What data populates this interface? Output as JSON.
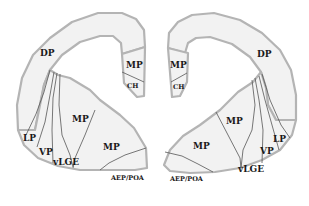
{
  "diagram": {
    "colors": {
      "tissue_fill": "#f2f2f2",
      "outline": "#b4b4b4",
      "boundary_lines": "#555555",
      "label_text": "#1a1a1a",
      "background": "#ffffff"
    },
    "left_hemisphere": {
      "labels": {
        "dp": "DP",
        "mp_top": "MP",
        "ch": "CH",
        "lp": "LP",
        "vp": "VP",
        "vlge": "vLGE",
        "mp_mid": "MP",
        "mp_lower": "MP",
        "aep_poa": "AEP/POA"
      }
    },
    "right_hemisphere": {
      "labels": {
        "dp": "DP",
        "mp_top": "MP",
        "ch": "CH",
        "lp": "LP",
        "vp": "VP",
        "vlge": "vLGE",
        "mp_mid": "MP",
        "mp_lower": "MP",
        "aep_poa": "AEP/POA"
      }
    }
  }
}
